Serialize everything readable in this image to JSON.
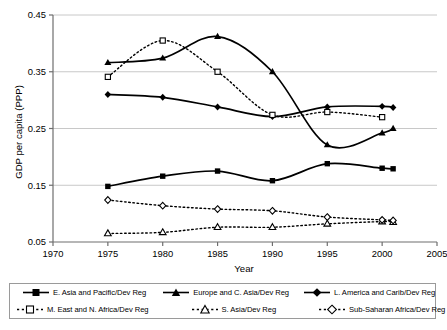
{
  "chart_data": {
    "type": "line",
    "title": "",
    "xlabel": "Year",
    "ylabel": "GDP per capita (PPP)",
    "xlim": [
      1970,
      2005
    ],
    "ylim": [
      0.05,
      0.45
    ],
    "xticks": [
      1970,
      1975,
      1980,
      1985,
      1990,
      1995,
      2000,
      2005
    ],
    "yticks": [
      0.05,
      0.15,
      0.25,
      0.35,
      0.45
    ],
    "xtick_labels": [
      "1970",
      "1975",
      "1980",
      "1985",
      "1990",
      "1995",
      "2000",
      "2005"
    ],
    "ytick_labels": [
      "0.05",
      "0.15",
      "0.25",
      "0.35",
      "0.45"
    ],
    "grid": "horizontal",
    "legend_position": "bottom",
    "x": [
      1975,
      1980,
      1985,
      1990,
      1995,
      2000,
      2001
    ],
    "series": [
      {
        "name": "E. Asia and Pacific/Dev Reg",
        "marker": "filled-square",
        "line": "solid",
        "color": "#000000",
        "values": [
          0.148,
          0.166,
          0.175,
          0.158,
          0.188,
          0.18,
          0.179
        ]
      },
      {
        "name": "Europe and C. Asia/Dev Reg",
        "marker": "filled-triangle",
        "line": "solid",
        "color": "#000000",
        "values": [
          0.366,
          0.374,
          0.412,
          0.35,
          0.221,
          0.242,
          0.25
        ]
      },
      {
        "name": "L. America and Carib/Dev Reg",
        "marker": "filled-diamond",
        "line": "solid",
        "color": "#000000",
        "values": [
          0.31,
          0.305,
          0.288,
          0.271,
          0.288,
          0.289,
          0.287
        ]
      },
      {
        "name": "M. East and N. Africa/Dev Reg",
        "marker": "open-square",
        "line": "dotted",
        "color": "#000000",
        "values": [
          0.341,
          0.405,
          0.35,
          0.274,
          0.279,
          0.27,
          null
        ]
      },
      {
        "name": "S. Asia/Dev Reg",
        "marker": "open-triangle",
        "line": "dotted",
        "color": "#000000",
        "values": [
          0.065,
          0.067,
          0.076,
          0.076,
          0.082,
          0.086,
          0.085
        ]
      },
      {
        "name": "Sub-Saharan Africa/Dev Reg",
        "marker": "open-diamond",
        "line": "dotted",
        "color": "#000000",
        "values": [
          0.124,
          0.114,
          0.108,
          0.105,
          0.094,
          0.089,
          0.088
        ]
      }
    ]
  },
  "axes": {
    "y_title": "GDP per capita (PPP)",
    "x_title": "Year",
    "y_labels": [
      "0.45",
      "0.35",
      "0.25",
      "0.15",
      "0.05"
    ],
    "x_labels": [
      "1970",
      "1975",
      "1980",
      "1985",
      "1990",
      "1995",
      "2000",
      "2005"
    ]
  },
  "legend": {
    "items": [
      {
        "label": "E. Asia and Pacific/Dev Reg",
        "marker": "filled-square",
        "line": "solid"
      },
      {
        "label": "Europe and C. Asia/Dev Reg",
        "marker": "filled-triangle",
        "line": "solid"
      },
      {
        "label": "L. America and Carib/Dev Reg",
        "marker": "filled-diamond",
        "line": "solid"
      },
      {
        "label": "M. East and N. Africa/Dev Reg",
        "marker": "open-square",
        "line": "dotted"
      },
      {
        "label": "S. Asia/Dev Reg",
        "marker": "open-triangle",
        "line": "dotted"
      },
      {
        "label": "Sub-Saharan Africa/Dev Reg",
        "marker": "open-diamond",
        "line": "dotted"
      }
    ]
  },
  "colors": {
    "ink": "#000000",
    "grid": "#c8c8c8",
    "axis": "#6e6e6e",
    "legend_border": "#9a9a9a",
    "background": "#ffffff"
  }
}
